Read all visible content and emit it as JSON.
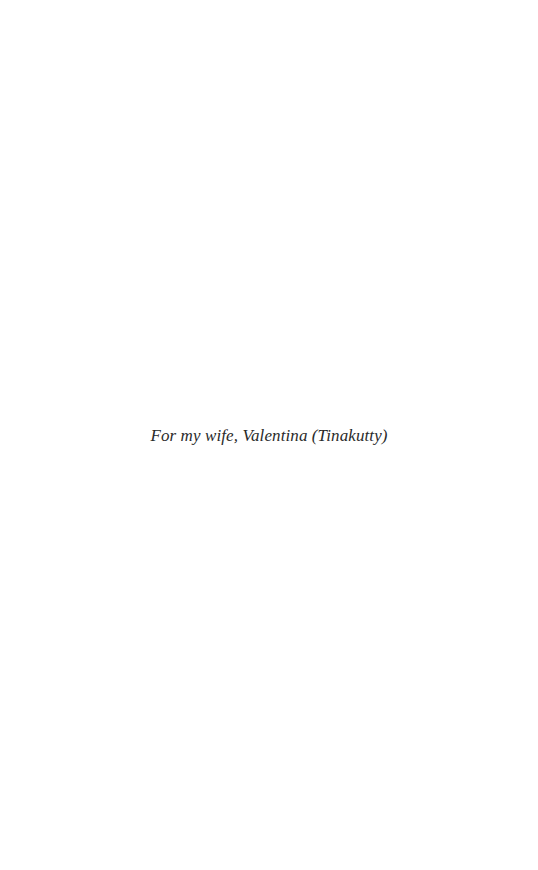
{
  "page": {
    "dedication": "For my wife, Valentina (Tinakutty)"
  }
}
